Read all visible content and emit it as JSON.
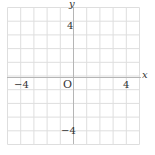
{
  "diagram": {
    "type": "coordinate-plane",
    "x_range": [
      -5,
      5
    ],
    "y_range": [
      -5,
      5
    ],
    "grid_step": 1,
    "axis_labels": {
      "x": "x",
      "y": "y"
    },
    "origin_label": "O",
    "tick_labels": {
      "x_neg": "−4",
      "x_pos": "4",
      "y_pos": "4",
      "y_neg": "−4"
    },
    "colors": {
      "grid": "#dcdcdc",
      "axis": "#b0b0b0",
      "text": "#333333"
    }
  }
}
